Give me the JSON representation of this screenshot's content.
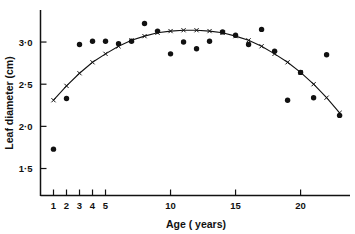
{
  "chart_data": {
    "type": "scatter",
    "title": "",
    "xlabel": "Age  ( years)",
    "ylabel": "Leaf  diameter  (cm)",
    "xlim": [
      0,
      23.8
    ],
    "ylim": [
      1.18,
      3.38
    ],
    "grid": false,
    "legend": "none",
    "x_ticks": [
      {
        "value": 1,
        "label": "1"
      },
      {
        "value": 2,
        "label": "2"
      },
      {
        "value": 3,
        "label": "3"
      },
      {
        "value": 4,
        "label": "4"
      },
      {
        "value": 5,
        "label": "5"
      },
      {
        "value": 10,
        "label": "10"
      },
      {
        "value": 15,
        "label": "15"
      },
      {
        "value": 20,
        "label": "20"
      }
    ],
    "y_ticks": [
      {
        "value": 1.5,
        "label": "1·5"
      },
      {
        "value": 2.0,
        "label": "2·0"
      },
      {
        "value": 2.5,
        "label": "2·5"
      },
      {
        "value": 3.0,
        "label": "3·0"
      }
    ],
    "series": [
      {
        "name": "observed",
        "marker": "filled-circle",
        "x": [
          1,
          2,
          3,
          4,
          5,
          6,
          7,
          8,
          9,
          10,
          11,
          12,
          13,
          14,
          15,
          16,
          17,
          18,
          19,
          20,
          21,
          22,
          23
        ],
        "y": [
          1.73,
          2.33,
          2.97,
          3.01,
          3.01,
          2.98,
          3.01,
          3.22,
          3.13,
          2.86,
          3.0,
          2.92,
          3.01,
          3.12,
          3.08,
          2.97,
          3.15,
          2.89,
          2.31,
          2.64,
          2.34,
          2.85,
          2.13
        ]
      },
      {
        "name": "fitted-quadratic",
        "marker": "cross",
        "x": [
          1,
          2,
          3,
          4,
          5,
          6,
          7,
          8,
          9,
          10,
          11,
          12,
          13,
          14,
          15,
          16,
          17,
          18,
          19,
          20,
          21,
          22,
          23
        ],
        "y": [
          2.31,
          2.48,
          2.63,
          2.76,
          2.86,
          2.95,
          3.02,
          3.07,
          3.11,
          3.13,
          3.14,
          3.14,
          3.13,
          3.11,
          3.07,
          3.02,
          2.95,
          2.86,
          2.76,
          2.64,
          2.5,
          2.34,
          2.16
        ]
      }
    ]
  }
}
